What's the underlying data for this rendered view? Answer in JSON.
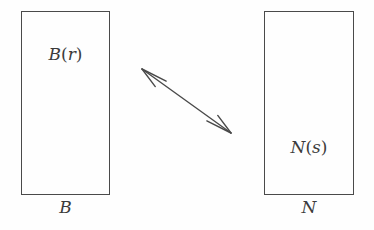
{
  "diagram": {
    "background_color": "#fefefe",
    "stroke_color": "#4a4a4a",
    "text_color": "#3b3b3b",
    "nodes": [
      {
        "id": "left-box",
        "caption": "B",
        "inner_label_letter": "B",
        "inner_label_arg": "r",
        "inner_label_full": "B(r)",
        "x": 21,
        "y": 11,
        "width": 89,
        "height": 184
      },
      {
        "id": "right-box",
        "caption": "N",
        "inner_label_letter": "N",
        "inner_label_arg": "s",
        "inner_label_full": "N(s)",
        "x": 264,
        "y": 11,
        "width": 90,
        "height": 184
      }
    ],
    "connector": {
      "id": "double-arrow",
      "type": "double-headed-arrow",
      "from": {
        "x": 231,
        "y": 133
      },
      "to": {
        "x": 142,
        "y": 69
      },
      "stroke_color": "#4a4a4a",
      "stroke_width": 1.4,
      "arrowhead_style": "barbed-open"
    },
    "open_paren": "(",
    "close_paren": ")"
  }
}
